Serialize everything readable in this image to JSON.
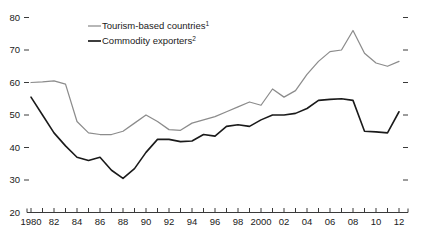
{
  "chart_data": {
    "type": "line",
    "title": "",
    "subtitle": "",
    "xlabel": "",
    "ylabel": "",
    "xlim": [
      1980,
      2012
    ],
    "ylim": [
      20,
      80
    ],
    "grid": false,
    "legend_position": "top-center",
    "y_ticks": [
      20,
      30,
      40,
      50,
      60,
      70,
      80
    ],
    "y_tick_labels": [
      "20",
      "30",
      "40",
      "50",
      "60",
      "70",
      "80"
    ],
    "x_ticks": [
      1980,
      1981,
      1982,
      1983,
      1984,
      1985,
      1986,
      1987,
      1988,
      1989,
      1990,
      1991,
      1992,
      1993,
      1994,
      1995,
      1996,
      1997,
      1998,
      1999,
      2000,
      2001,
      2002,
      2003,
      2004,
      2005,
      2006,
      2007,
      2008,
      2009,
      2010,
      2011,
      2012
    ],
    "x_tick_labels": [
      "1980",
      "",
      "82",
      "",
      "84",
      "",
      "86",
      "",
      "88",
      "",
      "90",
      "",
      "92",
      "",
      "94",
      "",
      "96",
      "",
      "98",
      "",
      "2000",
      "",
      "02",
      "",
      "04",
      "",
      "06",
      "",
      "08",
      "",
      "10",
      "",
      "12"
    ],
    "x": [
      1980,
      1981,
      1982,
      1983,
      1984,
      1985,
      1986,
      1987,
      1988,
      1989,
      1990,
      1991,
      1992,
      1993,
      1994,
      1995,
      1996,
      1997,
      1998,
      1999,
      2000,
      2001,
      2002,
      2003,
      2004,
      2005,
      2006,
      2007,
      2008,
      2009,
      2010,
      2011,
      2012
    ],
    "series": [
      {
        "name": "Tourism-based countries",
        "footnote": "1",
        "color": "#8c8c8c",
        "values": [
          60.0,
          60.2,
          60.5,
          59.5,
          48.0,
          44.5,
          44.0,
          44.0,
          45.0,
          47.5,
          50.0,
          48.0,
          45.5,
          45.3,
          47.5,
          48.5,
          49.5,
          51.0,
          52.5,
          54.0,
          53.0,
          58.0,
          55.5,
          57.5,
          62.5,
          66.5,
          69.5,
          70.0,
          76.0,
          69.0,
          66.0,
          65.0,
          66.5
        ]
      },
      {
        "name": "Commodity exporters",
        "footnote": "2",
        "color": "#1a1a1a",
        "values": [
          55.5,
          50.0,
          44.5,
          40.5,
          37.0,
          36.0,
          37.0,
          33.0,
          30.5,
          33.5,
          38.5,
          42.5,
          42.5,
          41.8,
          42.0,
          44.0,
          43.5,
          46.5,
          47.0,
          46.5,
          48.5,
          50.0,
          50.0,
          50.5,
          52.0,
          54.5,
          54.8,
          55.0,
          54.5,
          45.0,
          44.8,
          44.5,
          51.0
        ]
      }
    ]
  },
  "legend": {
    "items": [
      {
        "label": "Tourism-based countries",
        "sup": "1",
        "color": "#8c8c8c"
      },
      {
        "label": "Commodity exporters",
        "sup": "2",
        "color": "#1a1a1a"
      }
    ]
  }
}
